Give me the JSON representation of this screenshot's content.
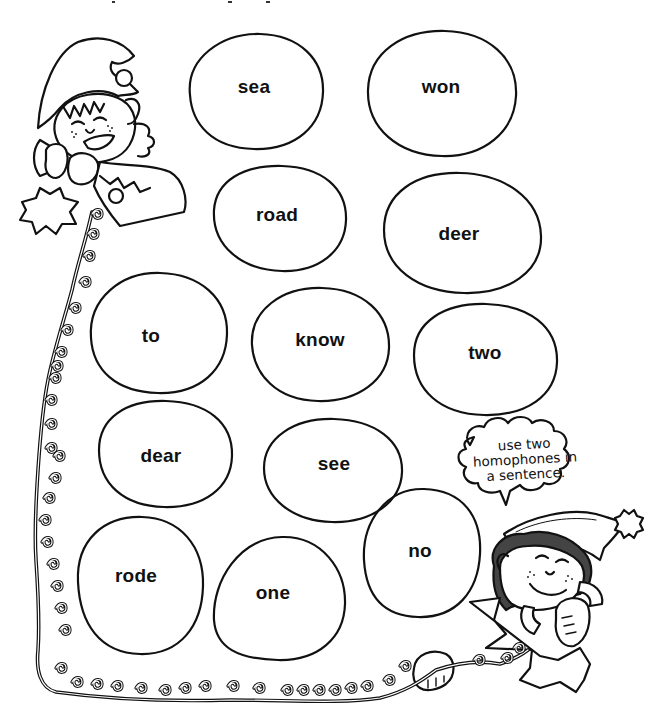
{
  "worksheet": {
    "theme_colors": {
      "ink": "#111111",
      "paper": "#ffffff"
    },
    "words": [
      {
        "id": "sea",
        "label": "sea",
        "cx": 256,
        "cy": 91,
        "rx": 67,
        "ry": 58
      },
      {
        "id": "won",
        "label": "won",
        "cx": 442,
        "cy": 93,
        "rx": 75,
        "ry": 63
      },
      {
        "id": "road",
        "label": "road",
        "cx": 280,
        "cy": 218,
        "rx": 67,
        "ry": 54
      },
      {
        "id": "deer",
        "label": "deer",
        "cx": 462,
        "cy": 232,
        "rx": 79,
        "ry": 61
      },
      {
        "id": "to",
        "label": "to",
        "cx": 159,
        "cy": 333,
        "rx": 69,
        "ry": 61
      },
      {
        "id": "know",
        "label": "know",
        "cx": 320,
        "cy": 344,
        "rx": 69,
        "ry": 58
      },
      {
        "id": "two",
        "label": "two",
        "cx": 485,
        "cy": 359,
        "rx": 72,
        "ry": 57
      },
      {
        "id": "dear",
        "label": "dear",
        "cx": 165,
        "cy": 453,
        "rx": 68,
        "ry": 54
      },
      {
        "id": "see",
        "label": "see",
        "cx": 333,
        "cy": 470,
        "rx": 70,
        "ry": 53
      },
      {
        "id": "rode",
        "label": "rode",
        "cx": 140,
        "cy": 585,
        "rx": 64,
        "ry": 69
      },
      {
        "id": "one",
        "label": "one",
        "cx": 279,
        "cy": 597,
        "rx": 66,
        "ry": 63
      },
      {
        "id": "no",
        "label": "no",
        "cx": 422,
        "cy": 552,
        "rx": 59,
        "ry": 65
      }
    ],
    "speech_bubble": {
      "lines": [
        "use two",
        "homophones in",
        "a sentence."
      ]
    },
    "illustrations": {
      "top_left": "elf-on-phone-icon",
      "bottom_right": "elf-on-phone-icon",
      "cord": "curly-phone-cord-icon"
    }
  }
}
